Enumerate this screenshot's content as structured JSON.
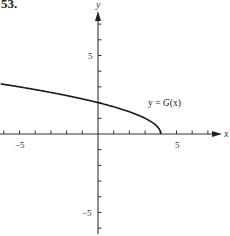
{
  "problem": {
    "number": "53."
  },
  "chart_data": {
    "type": "line",
    "title": "",
    "xlabel": "x",
    "ylabel": "y",
    "xlim": [
      -6.2,
      7.8
    ],
    "ylim": [
      -6.3,
      7.8
    ],
    "grid": false,
    "x_tick_step": 1,
    "y_tick_step": 1,
    "x_tick_labels": [
      {
        "value": -5,
        "label": "−5"
      },
      {
        "value": 5,
        "label": "5"
      }
    ],
    "y_tick_labels": [
      {
        "value": 5,
        "label": "5"
      },
      {
        "value": -5,
        "label": "−5"
      }
    ],
    "series": [
      {
        "name": "y = G(x)",
        "description": "Decreasing concave-down curve, approximately y = sqrt(4 - x), ending at (4, 0)",
        "x": [
          -6.2,
          -6,
          -5,
          -4,
          -3,
          -2,
          -1,
          0,
          1,
          2,
          3,
          3.5,
          3.8,
          4
        ],
        "y": [
          3.19,
          3.16,
          3.0,
          2.83,
          2.65,
          2.45,
          2.24,
          2.0,
          1.73,
          1.41,
          1.0,
          0.71,
          0.45,
          0.0
        ]
      }
    ],
    "annotations": [
      {
        "text": "y = G(x)",
        "x": 3.3,
        "y": 2.0
      }
    ],
    "color": "#1a1a1a"
  },
  "labels": {
    "x_axis": "x",
    "y_axis": "y",
    "x_neg5": "−5",
    "x_pos5": "5",
    "y_pos5": "5",
    "y_neg5": "−5",
    "curve_label_prefix": "y = ",
    "curve_label_func": "G",
    "curve_label_arg": "(x)"
  }
}
